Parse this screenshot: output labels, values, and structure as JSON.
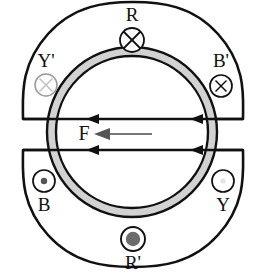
{
  "diagram": {
    "type": "physics-schematic",
    "colors": {
      "stroke": "#111111",
      "ring_fill": "#c9c9c9",
      "ring_fill_light": "#d8d8d8",
      "faint_marker": "#b9b9b9",
      "dot_fill": "#6b6b6b",
      "arrow_gray": "#777777",
      "background": "#ffffff"
    },
    "ring": {
      "name": "torus-annulus",
      "center_x": 132,
      "center_y": 132,
      "outer_radius": 85,
      "inner_radius": 76
    },
    "lobes": [
      {
        "name": "upper-lobe",
        "label": "R"
      },
      {
        "name": "lower-lobe",
        "label": "R'"
      }
    ],
    "markers": [
      {
        "id": "R",
        "label": "R",
        "glyph": "cross-in-circle",
        "label_pos": "above",
        "x": 132,
        "y": 36,
        "cx": 132,
        "cy": 63,
        "r": 12,
        "tone": "dark"
      },
      {
        "id": "Yp",
        "label": "Y'",
        "glyph": "cross-in-circle-faint",
        "label_pos": "above",
        "x": 46,
        "y": 63,
        "cx": 46,
        "cy": 85,
        "r": 11,
        "tone": "faint"
      },
      {
        "id": "Bp",
        "label": "B'",
        "glyph": "cross-in-circle",
        "label_pos": "above",
        "x": 221,
        "y": 63,
        "cx": 221,
        "cy": 86,
        "r": 11,
        "tone": "dark"
      },
      {
        "id": "B",
        "label": "B",
        "glyph": "dot-in-circle",
        "label_pos": "below",
        "x": 44,
        "y": 207,
        "cx": 44,
        "cy": 181,
        "r": 11,
        "tone": "dark"
      },
      {
        "id": "Y",
        "label": "Y",
        "glyph": "empty-circle",
        "label_pos": "below",
        "x": 223,
        "y": 207,
        "cx": 223,
        "cy": 181,
        "r": 11,
        "tone": "dark"
      },
      {
        "id": "Rp",
        "label": "R'",
        "glyph": "filled-dot-in-circle",
        "label_pos": "below",
        "x": 133,
        "y": 265,
        "cx": 133,
        "cy": 239,
        "r": 12,
        "tone": "dark"
      }
    ],
    "force": {
      "label": "F",
      "label_x": 84,
      "label_y": 134,
      "arrow_from_x": 152,
      "arrow_to_x": 96,
      "arrow_y": 134,
      "color": "#777777",
      "direction": "left"
    },
    "flux_lines": [
      {
        "name": "upper-flux-line",
        "y": 119,
        "arrowheads": [
          "left-at-88",
          "left-at-192"
        ]
      },
      {
        "name": "lower-flux-line",
        "y": 150,
        "arrowheads": [
          "left-at-88",
          "left-at-192"
        ]
      }
    ]
  }
}
